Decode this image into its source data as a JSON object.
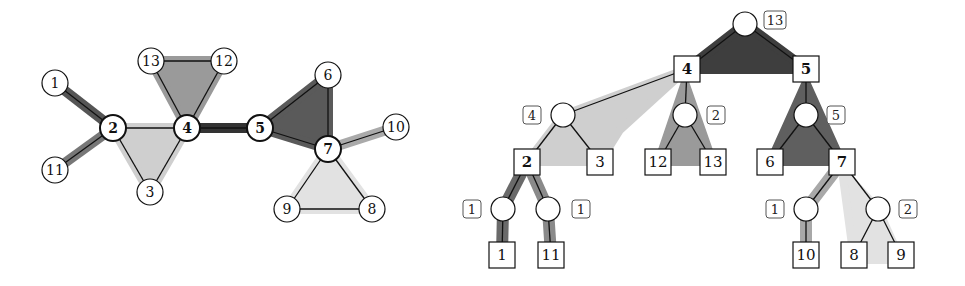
{
  "colors": {
    "dark": "#4a4a4a",
    "mid": "#8a8a8a",
    "light": "#c8c8c8",
    "lighter": "#dcdcdc",
    "line": "#111111"
  },
  "graph": {
    "nodes": [
      {
        "id": "1",
        "x": 55,
        "y": 83,
        "bold": false
      },
      {
        "id": "2",
        "x": 113,
        "y": 128,
        "bold": true
      },
      {
        "id": "11",
        "x": 55,
        "y": 170,
        "bold": false
      },
      {
        "id": "3",
        "x": 150,
        "y": 192,
        "bold": false
      },
      {
        "id": "4",
        "x": 187,
        "y": 128,
        "bold": true
      },
      {
        "id": "13",
        "x": 151,
        "y": 61,
        "bold": false
      },
      {
        "id": "12",
        "x": 224,
        "y": 61,
        "bold": false
      },
      {
        "id": "5",
        "x": 260,
        "y": 128,
        "bold": true
      },
      {
        "id": "6",
        "x": 328,
        "y": 75,
        "bold": false
      },
      {
        "id": "7",
        "x": 328,
        "y": 149,
        "bold": true
      },
      {
        "id": "10",
        "x": 396,
        "y": 127,
        "bold": false
      },
      {
        "id": "9",
        "x": 287,
        "y": 209,
        "bold": false
      },
      {
        "id": "8",
        "x": 372,
        "y": 209,
        "bold": false
      }
    ],
    "edges": [
      [
        "1",
        "2"
      ],
      [
        "2",
        "11"
      ],
      [
        "2",
        "4"
      ],
      [
        "2",
        "3"
      ],
      [
        "3",
        "4"
      ],
      [
        "4",
        "13"
      ],
      [
        "4",
        "12"
      ],
      [
        "13",
        "12"
      ],
      [
        "4",
        "5"
      ],
      [
        "5",
        "6"
      ],
      [
        "5",
        "7"
      ],
      [
        "6",
        "7"
      ],
      [
        "7",
        "10"
      ],
      [
        "7",
        "9"
      ],
      [
        "7",
        "8"
      ],
      [
        "9",
        "8"
      ]
    ]
  },
  "tree": {
    "root": {
      "x": 745,
      "y": 24,
      "label": "13",
      "lx": 775,
      "ly": 20
    },
    "boxes": [
      {
        "id": "4",
        "x": 687,
        "y": 69,
        "bold": true
      },
      {
        "id": "5",
        "x": 806,
        "y": 69,
        "bold": true
      },
      {
        "id": "2",
        "x": 527,
        "y": 162,
        "bold": true
      },
      {
        "id": "3",
        "x": 600,
        "y": 162,
        "bold": false
      },
      {
        "id": "12",
        "x": 658,
        "y": 162,
        "bold": false
      },
      {
        "id": "13",
        "x": 713,
        "y": 162,
        "bold": false
      },
      {
        "id": "6",
        "x": 770,
        "y": 162,
        "bold": false
      },
      {
        "id": "7",
        "x": 842,
        "y": 162,
        "bold": true
      },
      {
        "id": "1",
        "x": 502,
        "y": 255,
        "bold": false
      },
      {
        "id": "11",
        "x": 551,
        "y": 255,
        "bold": false
      },
      {
        "id": "10",
        "x": 806,
        "y": 255,
        "bold": false
      },
      {
        "id": "8",
        "x": 854,
        "y": 255,
        "bold": false
      },
      {
        "id": "9",
        "x": 901,
        "y": 255,
        "bold": false
      }
    ],
    "circles": [
      {
        "x": 563,
        "y": 115,
        "label": "4",
        "lx": 532,
        "ly": 115
      },
      {
        "x": 685,
        "y": 115,
        "label": "2",
        "lx": 716,
        "ly": 115
      },
      {
        "x": 806,
        "y": 115,
        "label": "5",
        "lx": 836,
        "ly": 115
      },
      {
        "x": 503,
        "y": 209,
        "label": "1",
        "lx": 472,
        "ly": 209
      },
      {
        "x": 548,
        "y": 209,
        "label": "1",
        "lx": 581,
        "ly": 209
      },
      {
        "x": 806,
        "y": 209,
        "label": "1",
        "lx": 775,
        "ly": 209
      },
      {
        "x": 878,
        "y": 209,
        "label": "2",
        "lx": 908,
        "ly": 209
      }
    ],
    "edges": [
      [
        745,
        24,
        687,
        69
      ],
      [
        745,
        24,
        806,
        69
      ],
      [
        687,
        69,
        563,
        115
      ],
      [
        687,
        69,
        685,
        115
      ],
      [
        806,
        69,
        806,
        115
      ],
      [
        563,
        115,
        527,
        162
      ],
      [
        563,
        115,
        600,
        162
      ],
      [
        685,
        115,
        658,
        162
      ],
      [
        685,
        115,
        713,
        162
      ],
      [
        806,
        115,
        770,
        162
      ],
      [
        806,
        115,
        842,
        162
      ],
      [
        527,
        162,
        503,
        209
      ],
      [
        527,
        162,
        548,
        209
      ],
      [
        503,
        209,
        502,
        255
      ],
      [
        548,
        209,
        551,
        255
      ],
      [
        842,
        162,
        806,
        209
      ],
      [
        842,
        162,
        878,
        209
      ],
      [
        806,
        209,
        806,
        255
      ],
      [
        878,
        209,
        854,
        255
      ],
      [
        878,
        209,
        901,
        255
      ]
    ]
  }
}
